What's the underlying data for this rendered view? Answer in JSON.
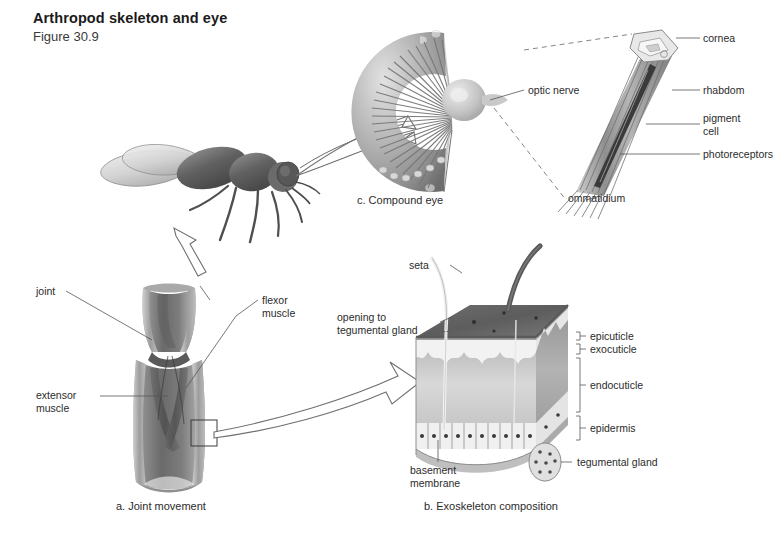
{
  "figure": {
    "title": "Arthropod skeleton and eye",
    "number": "Figure 30.9"
  },
  "panels": {
    "joint": {
      "caption": "a. Joint movement",
      "labels": {
        "joint": "joint",
        "flexor_muscle": "flexor\nmuscle",
        "extensor_muscle": "extensor\nmuscle"
      }
    },
    "exoskeleton": {
      "caption": "b. Exoskeleton composition",
      "labels": {
        "seta": "seta",
        "opening_to_tegumental_gland": "opening to\ntegumental gland",
        "epicuticle": "epicuticle",
        "exocuticle": "exocuticle",
        "endocuticle": "endocuticle",
        "epidermis": "epidermis",
        "tegumental_gland": "tegumental gland",
        "basement_membrane": "basement\nmembrane"
      }
    },
    "eye": {
      "caption": "c. Compound eye",
      "labels": {
        "optic_nerve": "optic nerve",
        "ommatidium": "ommatidium",
        "cornea": "cornea",
        "rhabdom": "rhabdom",
        "pigment_cell": "pigment\ncell",
        "photoreceptors": "photoreceptors"
      }
    }
  },
  "colors": {
    "background": "#ffffff",
    "text": "#2b2b2b",
    "leader": "#555555",
    "ink_dark": "#4a4a4a",
    "ink_mid": "#8a8a8a",
    "ink_light": "#cfcfcf"
  }
}
